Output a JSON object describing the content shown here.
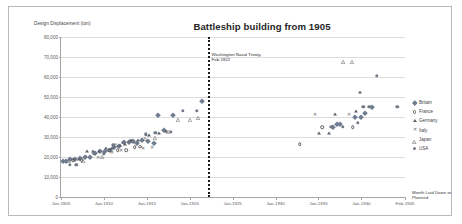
{
  "figure": {
    "title": "Battleship building from 1905",
    "y_axis_title": "Design Displacement (ton)",
    "x_axis_title": "Month Laid Down or Planned",
    "annotation_line1": "Washington Naval Treaty,",
    "annotation_line2": "Feb 1922"
  },
  "legend": {
    "items": [
      {
        "label": "Britain",
        "marker": "filled-diamond",
        "color": "#6f7c90"
      },
      {
        "label": "France",
        "marker": "open-circle",
        "color": "#5b5b5b"
      },
      {
        "label": "Germany",
        "marker": "filled-triangle",
        "color": "#5c6470"
      },
      {
        "label": "Italy",
        "marker": "cross",
        "color": "#6a6a6a"
      },
      {
        "label": "Japan",
        "marker": "open-triangle",
        "color": "#6a6a6a"
      },
      {
        "label": "USA",
        "marker": "filled-circle",
        "color": "#707a87"
      }
    ]
  },
  "chart_data": {
    "type": "scatter",
    "title": "Battleship building from 1905",
    "xlabel": "Month Laid Down or Planned",
    "ylabel": "Design Displacement (ton)",
    "grid": true,
    "legend_position": "right",
    "ylim": [
      0,
      80000
    ],
    "ytick_labels": [
      "80,000",
      "70,000",
      "60,000",
      "50,000",
      "40,000",
      "30,000",
      "20,000",
      "10,000",
      "0"
    ],
    "ytick_values": [
      80000,
      70000,
      60000,
      50000,
      40000,
      30000,
      20000,
      10000,
      0
    ],
    "xtick_labels": [
      "Jan-1905",
      "Jan-1910",
      "Jan-1915",
      "Jan-1920",
      "Jan-1925",
      "Jan-1930",
      "Jan-1935",
      "Jan-1940",
      "Feb-1945"
    ],
    "xtick_values": [
      1905.0,
      1910.0,
      1915.0,
      1920.0,
      1925.0,
      1930.0,
      1935.0,
      1940.0,
      1945.08
    ],
    "xlim": [
      1905.0,
      1945.08
    ],
    "annotations": [
      {
        "text": "Washington Naval Treaty, Feb 1922",
        "x": 1922.08,
        "type": "vertical-dotted-line"
      }
    ],
    "series": [
      {
        "name": "Britain",
        "marker": "filled-diamond",
        "points": [
          [
            1905.2,
            18100
          ],
          [
            1905.6,
            17900
          ],
          [
            1906.1,
            18800
          ],
          [
            1906.6,
            19200
          ],
          [
            1907.2,
            19600
          ],
          [
            1907.8,
            20100
          ],
          [
            1908.4,
            20200
          ],
          [
            1909.0,
            22200
          ],
          [
            1909.5,
            22800
          ],
          [
            1910.1,
            23000
          ],
          [
            1910.7,
            23400
          ],
          [
            1911.2,
            25000
          ],
          [
            1911.8,
            25500
          ],
          [
            1912.3,
            27500
          ],
          [
            1912.9,
            27500
          ],
          [
            1913.4,
            28000
          ],
          [
            1913.9,
            27000
          ],
          [
            1914.4,
            28500
          ],
          [
            1915.1,
            28000
          ],
          [
            1915.8,
            27000
          ],
          [
            1916.3,
            41200
          ],
          [
            1917.0,
            33500
          ],
          [
            1918.0,
            41200
          ],
          [
            1921.4,
            48000
          ],
          [
            1936.7,
            35000
          ],
          [
            1937.1,
            36700
          ],
          [
            1937.5,
            36700
          ],
          [
            1939.2,
            40000
          ],
          [
            1939.9,
            40000
          ],
          [
            1940.4,
            42000
          ],
          [
            1941.2,
            45000
          ]
        ]
      },
      {
        "name": "France",
        "marker": "open-circle",
        "points": [
          [
            1906.4,
            18300
          ],
          [
            1907.4,
            18300
          ],
          [
            1910.6,
            23500
          ],
          [
            1911.6,
            23500
          ],
          [
            1912.6,
            23500
          ],
          [
            1913.6,
            25000
          ],
          [
            1914.2,
            25200
          ],
          [
            1932.8,
            26500
          ],
          [
            1935.4,
            35000
          ],
          [
            1939.0,
            35000
          ]
        ]
      },
      {
        "name": "Germany",
        "marker": "filled-triangle",
        "points": [
          [
            1906.5,
            18900
          ],
          [
            1907.1,
            19000
          ],
          [
            1908.0,
            22800
          ],
          [
            1908.7,
            22800
          ],
          [
            1909.4,
            23000
          ],
          [
            1910.3,
            24700
          ],
          [
            1911.0,
            24700
          ],
          [
            1911.9,
            25800
          ],
          [
            1912.5,
            26600
          ],
          [
            1913.2,
            28600
          ],
          [
            1914.0,
            28600
          ],
          [
            1915.3,
            31000
          ],
          [
            1916.4,
            32200
          ],
          [
            1917.2,
            33000
          ],
          [
            1935.1,
            31800
          ],
          [
            1936.2,
            32000
          ],
          [
            1936.9,
            41700
          ],
          [
            1939.4,
            42900
          ],
          [
            1939.8,
            52600
          ]
        ]
      },
      {
        "name": "Italy",
        "marker": "cross",
        "points": [
          [
            1909.3,
            19500
          ],
          [
            1910.9,
            22000
          ],
          [
            1912.0,
            22900
          ],
          [
            1914.6,
            24000
          ],
          [
            1915.6,
            24500
          ],
          [
            1934.6,
            41200
          ],
          [
            1938.6,
            41200
          ]
        ]
      },
      {
        "name": "Japan",
        "marker": "open-triangle",
        "points": [
          [
            1905.9,
            19400
          ],
          [
            1907.6,
            19400
          ],
          [
            1909.8,
            21400
          ],
          [
            1911.4,
            27500
          ],
          [
            1913.0,
            29300
          ],
          [
            1914.8,
            30600
          ],
          [
            1915.9,
            31000
          ],
          [
            1917.5,
            33800
          ],
          [
            1918.6,
            39900
          ],
          [
            1920.0,
            39900
          ],
          [
            1921.0,
            41000
          ],
          [
            1937.9,
            69000
          ],
          [
            1938.9,
            69000
          ]
        ]
      },
      {
        "name": "USA",
        "marker": "filled-circle",
        "points": [
          [
            1906.0,
            16000
          ],
          [
            1906.8,
            16000
          ],
          [
            1907.9,
            20000
          ],
          [
            1908.9,
            21800
          ],
          [
            1910.0,
            21800
          ],
          [
            1911.1,
            26000
          ],
          [
            1912.2,
            27200
          ],
          [
            1913.5,
            27500
          ],
          [
            1914.9,
            31400
          ],
          [
            1916.0,
            32000
          ],
          [
            1917.8,
            32600
          ],
          [
            1919.2,
            43200
          ],
          [
            1920.8,
            43200
          ],
          [
            1936.5,
            35000
          ],
          [
            1937.8,
            35000
          ],
          [
            1939.6,
            37000
          ],
          [
            1940.2,
            45000
          ],
          [
            1940.9,
            45000
          ],
          [
            1941.8,
            60500
          ],
          [
            1944.2,
            45000
          ]
        ]
      }
    ]
  }
}
